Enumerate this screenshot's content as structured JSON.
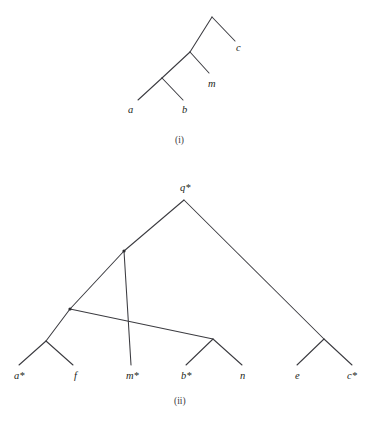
{
  "figure": {
    "background_color": "#ffffff",
    "line_color": "#3b3b40",
    "text_color": "#231f20",
    "panels": [
      {
        "id": "panel-i",
        "caption": "(i)",
        "caption_x": 175,
        "caption_y": 143,
        "nodes": [
          {
            "name": "root-i",
            "label": "",
            "x": 212,
            "y": 17,
            "dot": false
          },
          {
            "name": "internal-i-1",
            "label": "",
            "x": 190,
            "y": 52,
            "dot": false
          },
          {
            "name": "internal-i-2",
            "label": "",
            "x": 162,
            "y": 78,
            "dot": false
          }
        ],
        "leaves": [
          {
            "name": "leaf-a",
            "label": "a",
            "tip_x": 138,
            "tip_y": 100,
            "label_x": 128,
            "label_y": 113
          },
          {
            "name": "leaf-b",
            "label": "b",
            "tip_x": 183,
            "tip_y": 100,
            "label_x": 182,
            "label_y": 113
          },
          {
            "name": "leaf-m",
            "label": "m",
            "tip_x": 209,
            "tip_y": 73,
            "label_x": 208,
            "label_y": 87
          },
          {
            "name": "leaf-c",
            "label": "c",
            "tip_x": 235,
            "tip_y": 41,
            "label_x": 236,
            "label_y": 51
          }
        ],
        "edges": [
          {
            "name": "edge-root-to-c",
            "x1": 212,
            "y1": 17,
            "x2": 235,
            "y2": 41
          },
          {
            "name": "edge-root-to-internal1",
            "x1": 212,
            "y1": 17,
            "x2": 190,
            "y2": 52
          },
          {
            "name": "edge-internal1-to-m",
            "x1": 190,
            "y1": 52,
            "x2": 209,
            "y2": 73
          },
          {
            "name": "edge-internal1-to-internal2",
            "x1": 190,
            "y1": 52,
            "x2": 162,
            "y2": 78
          },
          {
            "name": "edge-internal2-to-a",
            "x1": 162,
            "y1": 78,
            "x2": 138,
            "y2": 100
          },
          {
            "name": "edge-internal2-to-b",
            "x1": 162,
            "y1": 78,
            "x2": 183,
            "y2": 100
          }
        ]
      },
      {
        "id": "panel-ii",
        "caption": "(ii)",
        "caption_x": 174,
        "caption_y": 404,
        "nodes": [
          {
            "name": "root-ii",
            "label": "q*",
            "x": 184,
            "y": 200,
            "dot": false,
            "label_x": 180,
            "label_y": 191
          },
          {
            "name": "internal-ii-star-1",
            "label": "*",
            "x": 124,
            "y": 251,
            "dot": true,
            "label_x": 119,
            "label_y": 252
          },
          {
            "name": "internal-ii-star-2",
            "label": "*",
            "x": 70,
            "y": 309,
            "dot": true,
            "label_x": 65,
            "label_y": 310
          },
          {
            "name": "internal-ii-af",
            "label": "",
            "x": 46,
            "y": 341,
            "dot": false
          },
          {
            "name": "internal-ii-bn",
            "label": "",
            "x": 213,
            "y": 339,
            "dot": false
          },
          {
            "name": "internal-ii-ec",
            "label": "",
            "x": 324,
            "y": 339,
            "dot": false
          }
        ],
        "leaves": [
          {
            "name": "leaf-a-star",
            "label": "a*",
            "tip_x": 19,
            "tip_y": 365,
            "label_x": 14,
            "label_y": 379
          },
          {
            "name": "leaf-f",
            "label": "f",
            "tip_x": 73,
            "tip_y": 365,
            "label_x": 74,
            "label_y": 379
          },
          {
            "name": "leaf-m-star",
            "label": "m*",
            "tip_x": 131,
            "tip_y": 365,
            "label_x": 126,
            "label_y": 379
          },
          {
            "name": "leaf-b-star",
            "label": "b*",
            "tip_x": 186,
            "tip_y": 365,
            "label_x": 181,
            "label_y": 379
          },
          {
            "name": "leaf-n",
            "label": "n",
            "tip_x": 242,
            "tip_y": 365,
            "label_x": 240,
            "label_y": 379
          },
          {
            "name": "leaf-e",
            "label": "e",
            "tip_x": 297,
            "tip_y": 365,
            "label_x": 295,
            "label_y": 379
          },
          {
            "name": "leaf-c-star",
            "label": "c*",
            "tip_x": 352,
            "tip_y": 365,
            "label_x": 347,
            "label_y": 379
          }
        ],
        "edges": [
          {
            "name": "edge-root-to-star1",
            "x1": 184,
            "y1": 200,
            "x2": 124,
            "y2": 251
          },
          {
            "name": "edge-root-to-ec",
            "x1": 184,
            "y1": 200,
            "x2": 324,
            "y2": 339
          },
          {
            "name": "edge-star1-to-star2",
            "x1": 124,
            "y1": 251,
            "x2": 70,
            "y2": 309
          },
          {
            "name": "edge-star1-to-mstar",
            "x1": 124,
            "y1": 251,
            "x2": 131,
            "y2": 365
          },
          {
            "name": "edge-star2-to-af",
            "x1": 70,
            "y1": 309,
            "x2": 46,
            "y2": 341
          },
          {
            "name": "edge-star2-to-bn",
            "x1": 70,
            "y1": 309,
            "x2": 213,
            "y2": 339
          },
          {
            "name": "edge-af-to-astar",
            "x1": 46,
            "y1": 341,
            "x2": 19,
            "y2": 365
          },
          {
            "name": "edge-af-to-f",
            "x1": 46,
            "y1": 341,
            "x2": 73,
            "y2": 365
          },
          {
            "name": "edge-bn-to-bstar",
            "x1": 213,
            "y1": 339,
            "x2": 186,
            "y2": 365
          },
          {
            "name": "edge-bn-to-n",
            "x1": 213,
            "y1": 339,
            "x2": 242,
            "y2": 365
          },
          {
            "name": "edge-ec-to-e",
            "x1": 324,
            "y1": 339,
            "x2": 297,
            "y2": 365
          },
          {
            "name": "edge-ec-to-cstar",
            "x1": 324,
            "y1": 339,
            "x2": 352,
            "y2": 365
          }
        ]
      }
    ]
  }
}
